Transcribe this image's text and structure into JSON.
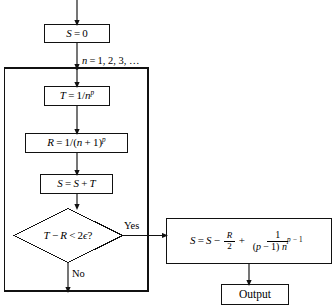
{
  "diagram": {
    "stroke_color": "#111111",
    "background_color": "#ffffff",
    "nodes": [
      {
        "id": "init",
        "type": "process",
        "text": "S = 0",
        "var": "S",
        "rhs": "0"
      },
      {
        "id": "t_assign",
        "type": "process",
        "text": "T = 1/n^p",
        "var": "T",
        "rhs_prefix": "1/",
        "rhs_base": "n",
        "rhs_exp": "p"
      },
      {
        "id": "r_assign",
        "type": "process",
        "text": "R = 1/(n + 1)^p",
        "var": "R",
        "rhs_prefix": "1/(",
        "rhs_inner_a": "n",
        "rhs_inner_op": "+",
        "rhs_inner_b": "1",
        "rhs_close": ")",
        "rhs_exp": "p"
      },
      {
        "id": "s_accum",
        "type": "process",
        "text": "S = S + T",
        "var": "S",
        "rhs_a": "S",
        "rhs_op": "+",
        "rhs_b": "T"
      },
      {
        "id": "decision",
        "type": "decision",
        "text": "T − R < 2ϵ?",
        "lhs_a": "T",
        "lhs_op": "−",
        "lhs_b": "R",
        "rel": "<",
        "rhs_coeff": "2",
        "rhs_sym": "ϵ",
        "question_mark": "?"
      },
      {
        "id": "correction",
        "type": "process",
        "text": "S = S − R/2 + 1/((p − 1) n^(p − 1))",
        "var": "S",
        "term1": "S",
        "op1": "−",
        "frac1_num": "R",
        "frac1_den": "2",
        "op2": "+",
        "frac2_num": "1",
        "frac2_den_a": "(",
        "frac2_den_p": "p",
        "frac2_den_minus": "−",
        "frac2_den_one": "1",
        "frac2_den_b": ")",
        "frac2_den_base": "n",
        "frac2_den_exp_p": "p",
        "frac2_den_exp_minus": "−",
        "frac2_den_exp_one": "1"
      },
      {
        "id": "output",
        "type": "terminal",
        "text": "Output"
      }
    ],
    "edge_labels": {
      "loop_counter": "n = 1, 2, 3, …",
      "loop_counter_var": "n",
      "loop_counter_eq": "=",
      "loop_counter_values": "1, 2, 3, …",
      "yes": "Yes",
      "no": "No"
    }
  }
}
